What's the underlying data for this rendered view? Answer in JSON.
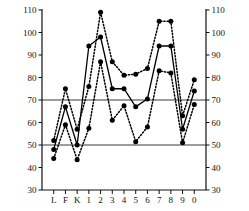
{
  "chart_data": {
    "type": "line",
    "title": "",
    "subtitle": "",
    "xlabel": "",
    "ylabel": "",
    "categories": [
      "L",
      "F",
      "K",
      "1",
      "2",
      "3",
      "4",
      "5",
      "6",
      "7",
      "8",
      "9",
      "0"
    ],
    "ylim": [
      30,
      110
    ],
    "yticks": [
      30,
      40,
      50,
      60,
      70,
      80,
      90,
      100,
      110
    ],
    "ytick_labels": [
      "30",
      "40",
      "50",
      "60",
      "70",
      "80",
      "90",
      "100",
      "110"
    ],
    "right_axis": {
      "ylim": [
        30,
        110
      ],
      "yticks": [
        30,
        40,
        50,
        60,
        70,
        80,
        90,
        100,
        110
      ],
      "ytick_labels": [
        "30",
        "40",
        "50",
        "60",
        "70",
        "80",
        "90",
        "100",
        "110"
      ]
    },
    "grid": false,
    "reference_lines": [
      50,
      70
    ],
    "legend": "none",
    "marker": "filled-circle",
    "series": [
      {
        "name": "upper",
        "style": "dotted",
        "color": "#000000",
        "values": [
          52,
          75,
          57,
          76,
          109,
          87,
          81,
          81.5,
          84,
          105,
          105,
          63,
          79
        ]
      },
      {
        "name": "middle",
        "style": "solid",
        "color": "#000000",
        "values": [
          48,
          67,
          50,
          94,
          98,
          75,
          75,
          67,
          70.5,
          94,
          94,
          57,
          74
        ]
      },
      {
        "name": "lower",
        "style": "dotted",
        "color": "#000000",
        "values": [
          44,
          59,
          43.5,
          57.5,
          87,
          61,
          67.5,
          51.5,
          58,
          83,
          82,
          51,
          68
        ]
      }
    ]
  },
  "axes": {
    "left_ticks": [
      "110",
      "100",
      "90",
      "80",
      "70",
      "60",
      "50",
      "40",
      "30"
    ],
    "right_ticks": [
      "110",
      "100",
      "90",
      "80",
      "70",
      "60",
      "50",
      "40",
      "30"
    ],
    "x_ticks": [
      "L",
      "F",
      "K",
      "1",
      "2",
      "3",
      "4",
      "5",
      "6",
      "7",
      "8",
      "9",
      "0"
    ]
  }
}
